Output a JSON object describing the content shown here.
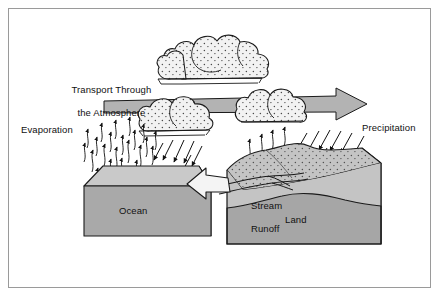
{
  "figure": {
    "background": "#ffffff",
    "frame_color": "#9a9a9a"
  },
  "labels": {
    "transport_line1": "Transport Through",
    "transport_line2": "the Atmosphere",
    "evaporation": "Evaporation",
    "precipitation": "Precipitation",
    "stream_line1": "Stream",
    "stream_line2": "Runoff",
    "ocean": "Ocean",
    "land": "Land"
  },
  "colors": {
    "outline": "#1a1a1a",
    "cloud_fill": "#f2f2f2",
    "stipple": "#2b2b2b",
    "arrow_gray": "#b3b3b3",
    "block_top": "#c9c9c9",
    "block_front": "#a9a9a9",
    "land_top": "#c4c4c4",
    "land_front": "#a6a6a6",
    "runoff_arrow": "#f4f4f4",
    "text": "#111111"
  },
  "diagram_elements": {
    "clouds": [
      {
        "name": "cloud-upper-cluster",
        "role": "condensed moisture aloft"
      },
      {
        "name": "cloud-middle",
        "role": "precipitating cloud over ocean"
      },
      {
        "name": "cloud-right",
        "role": "precipitating cloud over land"
      }
    ],
    "arrows": [
      {
        "name": "transport-arrow",
        "direction": "right",
        "style": "thick gray band with arrowhead"
      },
      {
        "name": "evaporation-arrows",
        "direction": "up",
        "count": 22,
        "style": "thin wavy"
      },
      {
        "name": "rain-arrows-ocean",
        "direction": "down-left",
        "count": 6,
        "style": "straight"
      },
      {
        "name": "precipitation-arrows-land",
        "direction": "down-left",
        "count": 9,
        "style": "straight"
      },
      {
        "name": "stream-runoff-arrow",
        "direction": "left",
        "style": "outlined white block arrow"
      }
    ],
    "blocks": [
      {
        "name": "ocean-block",
        "label": "Ocean"
      },
      {
        "name": "land-block",
        "label": "Land"
      }
    ]
  }
}
